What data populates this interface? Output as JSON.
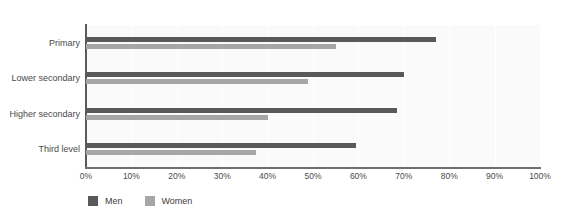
{
  "caption": {
    "clipped_text": ""
  },
  "legend": {
    "position": "bottom-left",
    "items": [
      {
        "label": "Men",
        "color": "#595959",
        "swatch_name": "legend-swatch-men"
      },
      {
        "label": "Women",
        "color": "#a6a6a6",
        "swatch_name": "legend-swatch-women"
      }
    ]
  },
  "colors": {
    "men": "#595959",
    "women": "#a6a6a6",
    "plot_background": "#fafafa",
    "gridline": "#ffffff",
    "axis": "#5a5a5a",
    "text": "#4a4a4a"
  },
  "chart_data": {
    "type": "bar",
    "orientation": "horizontal",
    "title": "",
    "subtitle": "",
    "xlabel": "",
    "ylabel": "",
    "xlim": [
      0,
      100
    ],
    "grid": true,
    "legend_position": "bottom-left",
    "categories": [
      "Primary",
      "Lower secondary",
      "Higher secondary",
      "Third level"
    ],
    "tick_labels": [
      "0%",
      "10%",
      "20%",
      "30%",
      "40%",
      "50%",
      "60%",
      "70%",
      "80%",
      "90%",
      "100%"
    ],
    "tick_values": [
      0,
      10,
      20,
      30,
      40,
      50,
      60,
      70,
      80,
      90,
      100
    ],
    "series": [
      {
        "name": "Men",
        "color": "#595959",
        "values": [
          77,
          70,
          68.5,
          59.5
        ]
      },
      {
        "name": "Women",
        "color": "#a6a6a6",
        "values": [
          55,
          49,
          40,
          37.5
        ]
      }
    ]
  }
}
